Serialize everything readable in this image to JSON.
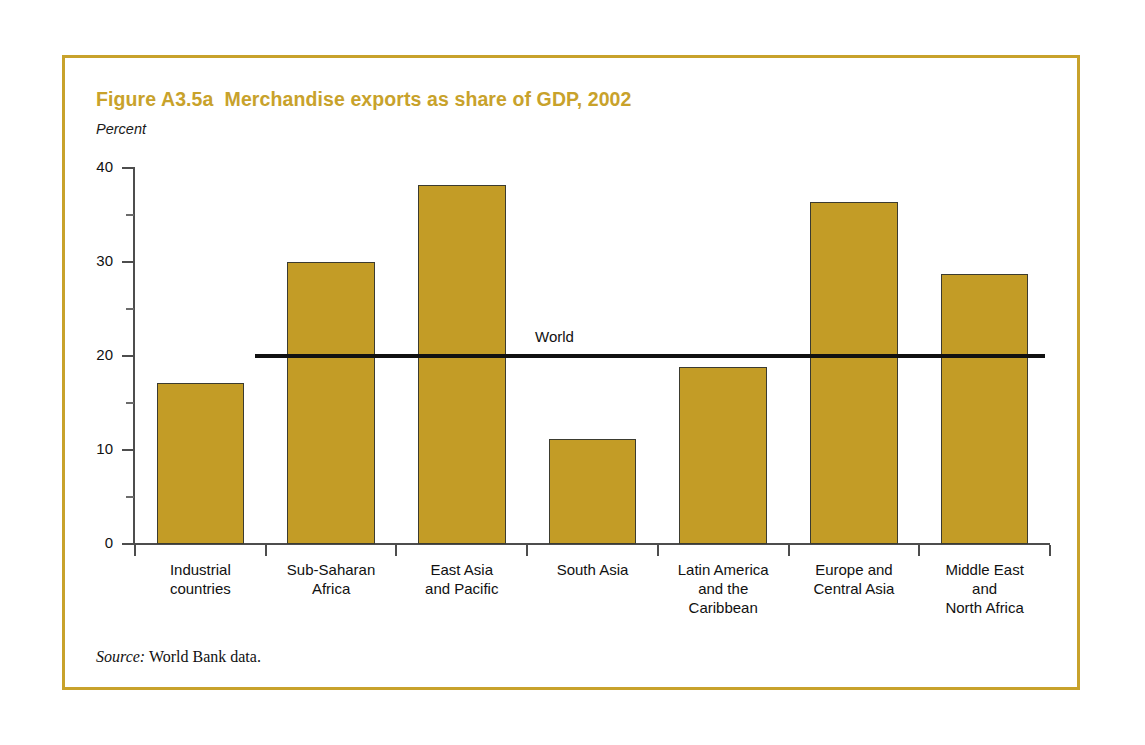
{
  "figure": {
    "title": "Figure A3.5a  Merchandise exports as share of GDP, 2002",
    "axis_unit": "Percent",
    "source_label": "Source:",
    "source_text": " World Bank data.",
    "border_color": "#c8a22b",
    "title_color": "#c8a22b",
    "bar_color": "#c39c26",
    "bar_outline_color": "#3b3b30",
    "reference_line_color": "#111111"
  },
  "chart_data": {
    "type": "bar",
    "title": "Figure A3.5a  Merchandise exports as share of GDP, 2002",
    "subtitle": "",
    "xlabel": "",
    "ylabel": "Percent",
    "ylim": [
      0,
      40
    ],
    "yticks": [
      0,
      10,
      20,
      30,
      40
    ],
    "ytick_labels": [
      "0",
      "10",
      "20",
      "30",
      "40"
    ],
    "minor_yticks": [
      5,
      15,
      25,
      35
    ],
    "grid": false,
    "legend": "none",
    "categories": [
      "Industrial\ncountries",
      "Sub-Saharan\nAfrica",
      "East Asia\nand Pacific",
      "South Asia",
      "Latin America\nand the\nCaribbean",
      "Europe and\nCentral Asia",
      "Middle East\nand\nNorth Africa"
    ],
    "values": [
      17.1,
      30.0,
      38.2,
      11.2,
      18.8,
      36.4,
      28.7
    ],
    "annotations": [
      {
        "label": "World",
        "type": "horizontal-reference-line",
        "value": 20
      }
    ]
  }
}
